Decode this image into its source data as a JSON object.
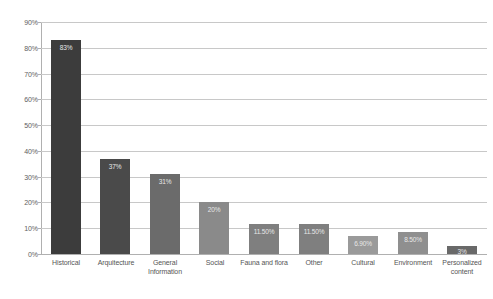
{
  "chart_data": {
    "type": "bar",
    "title": "",
    "subtitle": "",
    "xlabel": "",
    "ylabel": "",
    "ylim": [
      0,
      90
    ],
    "ytick_labels": [
      "90%",
      "80%",
      "70%",
      "60%",
      "50%",
      "40%",
      "30%",
      "20%",
      "10%",
      "0%"
    ],
    "ytick_values": [
      90,
      80,
      70,
      60,
      50,
      40,
      30,
      20,
      10,
      0
    ],
    "grid": true,
    "legend": "none",
    "categories": [
      "Historical",
      "Arquitecture",
      "General Information",
      "Social",
      "Fauna and flora",
      "Other",
      "Cultural",
      "Environment",
      "Personalized content"
    ],
    "values": [
      83,
      37,
      31,
      20,
      11.5,
      11.5,
      6.9,
      8.5,
      3
    ],
    "data_labels": [
      "83%",
      "37%",
      "31%",
      "20%",
      "11.50%",
      "11.50%",
      "6.90%",
      "8.50%",
      "3%"
    ],
    "bar_colors": [
      "#3c3c3c",
      "#4a4a4a",
      "#6b6b6b",
      "#8a8a8a",
      "#7f7f7f",
      "#7f7f7f",
      "#9a9a9a",
      "#8f8f8f",
      "#696969"
    ]
  }
}
